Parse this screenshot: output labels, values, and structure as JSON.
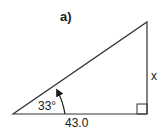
{
  "figure": {
    "label": "a)",
    "angle_label": "33°",
    "base_label": "43.0",
    "side_label": "x",
    "line_color": "#333333",
    "text_color": "#1a1a1a"
  },
  "geometry": {
    "type": "right-triangle",
    "angle_degrees": 33,
    "adjacent_side": 43.0,
    "opposite_side": "x",
    "right_angle_corner": "bottom-right"
  }
}
